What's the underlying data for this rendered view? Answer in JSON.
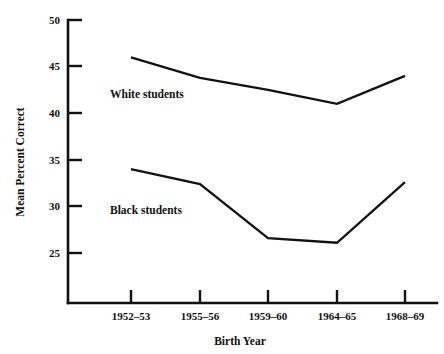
{
  "chart_data": {
    "type": "line",
    "title": "",
    "subtitle": "",
    "xlabel": "Birth Year",
    "ylabel": "Mean Percent Correct",
    "categories": [
      "1952–53",
      "1955–56",
      "1959–60",
      "1964–65",
      "1968–69"
    ],
    "ylim": [
      25,
      50
    ],
    "yticks": [
      25,
      30,
      35,
      40,
      45,
      50
    ],
    "ytick_labels": [
      "25",
      "30",
      "35",
      "40",
      "45",
      "50"
    ],
    "grid": false,
    "legend_position": "inline-annotation",
    "series": [
      {
        "name": "White students",
        "values": [
          46.0,
          43.8,
          42.5,
          41.0,
          44.0
        ],
        "annotation": "White students"
      },
      {
        "name": "Black students",
        "values": [
          34.0,
          32.4,
          26.6,
          26.1,
          32.6
        ],
        "annotation": "Black students"
      }
    ],
    "annotations": [
      {
        "text": "White students",
        "near_series": "White students"
      },
      {
        "text": "Black students",
        "near_series": "Black students"
      }
    ],
    "colors": {
      "line": "#111111",
      "axis": "#111111",
      "background": "#ffffff"
    }
  },
  "axes": {
    "y_axis_title": "Mean Percent Correct",
    "x_axis_title": "Birth Year"
  }
}
